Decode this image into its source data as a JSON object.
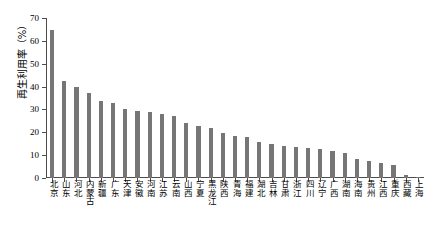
{
  "chart_data": {
    "type": "bar",
    "title": "",
    "xlabel": "",
    "ylabel": "再生利用率（%）",
    "ylim": [
      0,
      70
    ],
    "ytick_values": [
      0,
      10,
      20,
      30,
      40,
      50,
      60,
      70
    ],
    "ytick_labels": [
      "0",
      "10",
      "20",
      "30",
      "40",
      "50",
      "60",
      "70"
    ],
    "grid": false,
    "legend": null,
    "bar_color": "#767676",
    "axis_color": "#4d4d4d",
    "categories": [
      "北京",
      "山东",
      "河北",
      "内蒙古",
      "新疆",
      "广东",
      "天津",
      "安徽",
      "河南",
      "江苏",
      "云南",
      "山西",
      "宁夏",
      "黑龙江",
      "陕西",
      "青海",
      "福建",
      "湖北",
      "吉林",
      "甘肃",
      "浙江",
      "四川",
      "辽宁",
      "广西",
      "湖南",
      "海南",
      "贵州",
      "江西",
      "重庆",
      "西藏",
      "上海"
    ],
    "values": [
      64.8,
      42.6,
      39.8,
      37.2,
      33.8,
      32.8,
      30.2,
      29.4,
      28.8,
      28.2,
      27.0,
      24.0,
      22.6,
      22.0,
      19.6,
      18.6,
      18.0,
      15.8,
      15.0,
      14.2,
      13.6,
      13.2,
      12.6,
      11.8,
      11.0,
      8.4,
      7.4,
      6.6,
      5.6,
      1.4,
      0.6
    ]
  }
}
